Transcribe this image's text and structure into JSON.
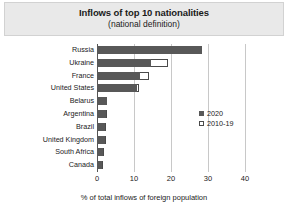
{
  "chart_data": {
    "type": "bar",
    "orientation": "horizontal",
    "title": "Inflows of top 10 nationalities",
    "subtitle": "(national definition)",
    "xlabel": "% of total inflows of foreign population",
    "ylabel": "",
    "xlim": [
      0,
      40
    ],
    "xticks": [
      0,
      10,
      20,
      30,
      40
    ],
    "grid": true,
    "legend_position": "center-right",
    "categories": [
      "Russia",
      "Ukraine",
      "France",
      "United States",
      "Belarus",
      "Argentina",
      "Brazil",
      "United Kingdom",
      "South Africa",
      "Canada"
    ],
    "series": [
      {
        "name": "2020",
        "color": "#585858",
        "values": [
          28.4,
          14.5,
          11.6,
          10.8,
          2.6,
          2.4,
          2.2,
          2.1,
          1.6,
          1.4
        ]
      },
      {
        "name": "2010-19",
        "color": "#ffffff",
        "values": [
          28.4,
          19.2,
          14.0,
          11.3,
          2.8,
          2.6,
          2.3,
          2.3,
          1.8,
          1.6
        ]
      }
    ]
  },
  "legend": {
    "items": [
      {
        "label": "2020",
        "swatch": "filled"
      },
      {
        "label": "2010-19",
        "swatch": "open"
      }
    ]
  }
}
